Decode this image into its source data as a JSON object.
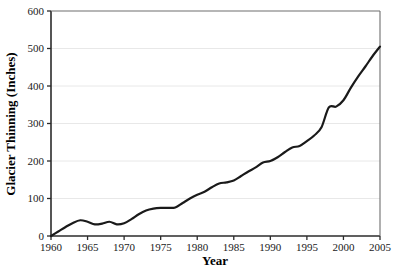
{
  "chart_data": {
    "type": "line",
    "title": "",
    "xlabel": "Year",
    "ylabel": "Glacier Thinning (Inches)",
    "xlim": [
      1960,
      2005
    ],
    "ylim": [
      0,
      600
    ],
    "xticks": [
      1960,
      1965,
      1970,
      1975,
      1980,
      1985,
      1990,
      1995,
      2000,
      2005
    ],
    "yticks": [
      0,
      100,
      200,
      300,
      400,
      500,
      600
    ],
    "grid": "horizontal",
    "legend": "none",
    "line_color": "#1a1a1a",
    "line_width": 2.2,
    "series": [
      {
        "name": "Cumulative Glacier Thinning",
        "x": [
          1960,
          1961,
          1962,
          1963,
          1964,
          1965,
          1966,
          1967,
          1968,
          1969,
          1970,
          1971,
          1972,
          1973,
          1974,
          1975,
          1976,
          1977,
          1978,
          1979,
          1980,
          1981,
          1982,
          1983,
          1984,
          1985,
          1986,
          1987,
          1988,
          1989,
          1990,
          1991,
          1992,
          1993,
          1994,
          1995,
          1996,
          1997,
          1998,
          1999,
          2000,
          2001,
          2002,
          2003,
          2004,
          2005
        ],
        "values": [
          0,
          12,
          24,
          35,
          42,
          38,
          31,
          33,
          38,
          31,
          34,
          45,
          58,
          68,
          73,
          75,
          75,
          76,
          88,
          100,
          110,
          118,
          130,
          140,
          143,
          148,
          160,
          172,
          183,
          196,
          200,
          210,
          224,
          236,
          240,
          253,
          268,
          290,
          343,
          345,
          362,
          395,
          425,
          452,
          480,
          505
        ]
      }
    ]
  },
  "layout": {
    "plot_left": 51,
    "plot_right": 380,
    "plot_top": 11,
    "plot_bottom": 236,
    "axis_color": "#2b2b2b",
    "grid_color": "#e8e8e8",
    "background": "#ffffff"
  }
}
